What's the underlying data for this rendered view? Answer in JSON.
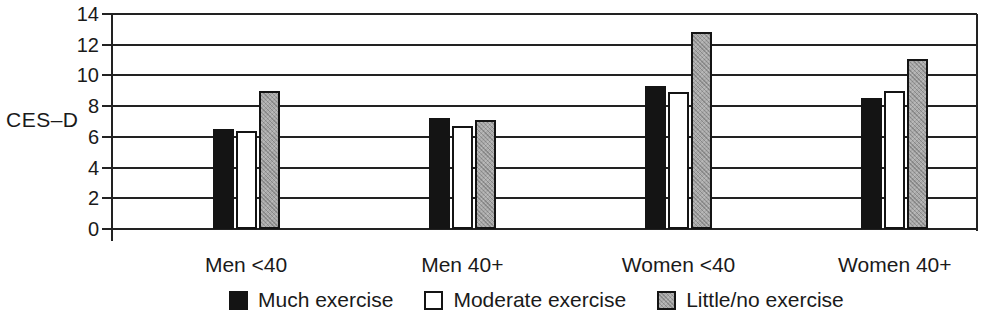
{
  "chart_data": {
    "type": "bar",
    "title": "",
    "xlabel": "",
    "ylabel": "CES–D",
    "categories": [
      "Men <40",
      "Men 40+",
      "Women <40",
      "Women 40+"
    ],
    "series": [
      {
        "name": "Much exercise",
        "color": "#141414",
        "pattern": "solid",
        "values": [
          6.5,
          7.2,
          9.3,
          8.5
        ]
      },
      {
        "name": "Moderate exercise",
        "color": "#ffffff",
        "pattern": "outline",
        "values": [
          6.4,
          6.7,
          8.9,
          9.0
        ]
      },
      {
        "name": "Little/no exercise",
        "color": "#a9a9a9",
        "pattern": "halftone",
        "values": [
          9.0,
          7.1,
          12.8,
          11.1
        ]
      }
    ],
    "ylim": [
      0,
      14
    ],
    "yticks": [
      0,
      2,
      4,
      6,
      8,
      10,
      12,
      14
    ],
    "grid": true,
    "grid_color": "#222222",
    "legend_position": "bottom",
    "background_color": "#ffffff"
  }
}
